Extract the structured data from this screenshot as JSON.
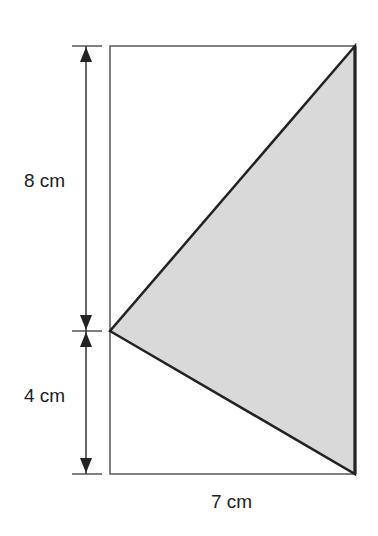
{
  "figure": {
    "type": "geometry",
    "labels": {
      "upper_height": "8 cm",
      "lower_height": "4 cm",
      "width": "7 cm"
    },
    "colors": {
      "fill": "#d9d9d9",
      "stroke": "#222222",
      "rect_stroke": "#555555"
    }
  }
}
